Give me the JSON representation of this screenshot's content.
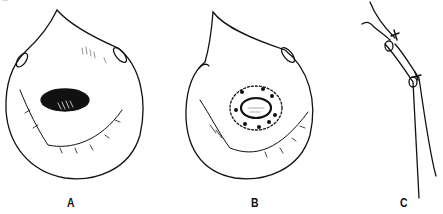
{
  "figure": {
    "top_caption_fragment": "...",
    "panels": [
      {
        "id": "A",
        "label": "A",
        "x": 66,
        "description": "drop-shaped outline with dark irregular lesion at centre"
      },
      {
        "id": "B",
        "label": "B",
        "x": 250,
        "description": "drop-shaped outline with oval incision surrounded by dashed circle and sutures"
      },
      {
        "id": "C",
        "label": "C",
        "x": 399,
        "description": "side view of tube with two knotted ties"
      }
    ]
  }
}
